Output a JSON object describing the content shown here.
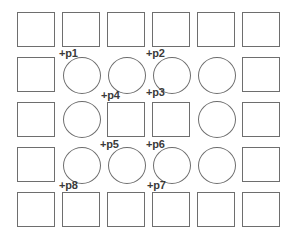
{
  "diagram": {
    "grid": {
      "columns": 6,
      "rows": 5,
      "col_x": [
        17,
        62,
        107,
        152,
        197,
        242
      ],
      "row_y": [
        12,
        57,
        102,
        147,
        192
      ],
      "cell_width": 38,
      "cell_height": 35,
      "stroke_color": "#6e6e6e",
      "background": "#ffffff"
    },
    "cells": [
      [
        "square",
        "square",
        "square",
        "square",
        "square",
        "square"
      ],
      [
        "square",
        "circle",
        "circle",
        "circle",
        "circle",
        "square"
      ],
      [
        "square",
        "circle",
        "square",
        "square",
        "circle",
        "square"
      ],
      [
        "square",
        "circle",
        "circle",
        "circle",
        "circle",
        "square"
      ],
      [
        "square",
        "square",
        "square",
        "square",
        "square",
        "square"
      ]
    ],
    "points": [
      {
        "id": "p1",
        "label": "+p1",
        "x": 59,
        "y": 48
      },
      {
        "id": "p2",
        "label": "+p2",
        "x": 146,
        "y": 48
      },
      {
        "id": "p3",
        "label": "+p3",
        "x": 146,
        "y": 87
      },
      {
        "id": "p4",
        "label": "+p4",
        "x": 101,
        "y": 90
      },
      {
        "id": "p5",
        "label": "+p5",
        "x": 100,
        "y": 139
      },
      {
        "id": "p6",
        "label": "+p6",
        "x": 146,
        "y": 139
      },
      {
        "id": "p7",
        "label": "+p7",
        "x": 147,
        "y": 180
      },
      {
        "id": "p8",
        "label": "+p8",
        "x": 59,
        "y": 180
      }
    ],
    "label_color": "#3a3a3a"
  }
}
